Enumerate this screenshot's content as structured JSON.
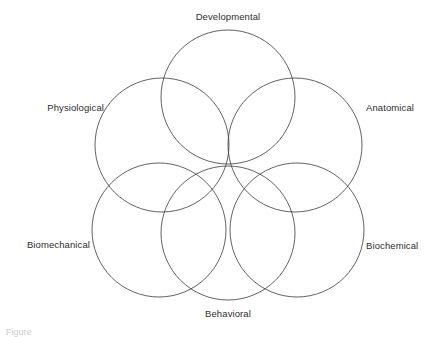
{
  "figure": {
    "type": "venn-diagram",
    "background_color": "#ffffff",
    "stroke_color": "#3a3a3a",
    "stroke_width": 0.8,
    "fill": "none",
    "canvas": {
      "width": 436,
      "height": 336
    }
  },
  "diagram_data": {
    "type": "venn",
    "set_count": 6,
    "center": {
      "x": 228,
      "y": 167
    },
    "radius": 67,
    "sets": [
      {
        "id": "developmental",
        "label": "Developmental",
        "circle": {
          "cx": 228,
          "cy": 97,
          "r": 67
        },
        "label_pos": {
          "x": 228,
          "y": 17
        },
        "label_anchor": "middle"
      },
      {
        "id": "anatomical",
        "label": "Anatomical",
        "circle": {
          "cx": 295,
          "cy": 145,
          "r": 67
        },
        "label_pos": {
          "x": 366,
          "y": 108
        },
        "label_anchor": "start"
      },
      {
        "id": "biochemical",
        "label": "Biochemical",
        "circle": {
          "cx": 297,
          "cy": 230,
          "r": 67
        },
        "label_pos": {
          "x": 366,
          "y": 246
        },
        "label_anchor": "start"
      },
      {
        "id": "behavioral",
        "label": "Behavioral",
        "circle": {
          "cx": 228,
          "cy": 233,
          "r": 67
        },
        "label_pos": {
          "x": 228,
          "y": 314
        },
        "label_anchor": "middle"
      },
      {
        "id": "biomechanical",
        "label": "Biomechanical",
        "circle": {
          "cx": 159,
          "cy": 230,
          "r": 67
        },
        "label_pos": {
          "x": 90,
          "y": 245
        },
        "label_anchor": "end"
      },
      {
        "id": "physiological",
        "label": "Physiological",
        "circle": {
          "cx": 162,
          "cy": 145,
          "r": 67
        },
        "label_pos": {
          "x": 104,
          "y": 108
        },
        "label_anchor": "end"
      }
    ]
  },
  "labels": {
    "developmental": "Developmental",
    "anatomical": "Anatomical",
    "biochemical": "Biochemical",
    "behavioral": "Behavioral",
    "biomechanical": "Biomechanical",
    "physiological": "Physiological"
  },
  "caption": {
    "text": "Figure"
  }
}
